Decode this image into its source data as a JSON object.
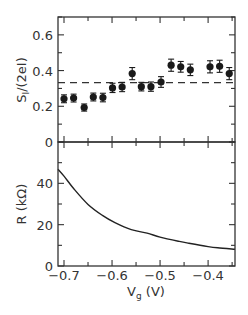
{
  "chart_data": [
    {
      "type": "scatter",
      "panel": "top",
      "title": "",
      "xlabel": "",
      "ylabel": "S_I/(2eI)",
      "ylabel_parts": {
        "main": "S",
        "sub": "I",
        "rest": "/(2eI)"
      },
      "xlim": [
        -0.7125,
        -0.344
      ],
      "ylim": [
        0,
        0.7
      ],
      "yticks": [
        0,
        0.2,
        0.4,
        0.6
      ],
      "ytick_labels": [
        "0",
        "0.2",
        "0.4",
        "0.6"
      ],
      "grid": false,
      "series": [
        {
          "name": "measured",
          "marker": "filled-circle",
          "x": [
            -0.7,
            -0.68,
            -0.658,
            -0.639,
            -0.619,
            -0.599,
            -0.579,
            -0.558,
            -0.539,
            -0.519,
            -0.498,
            -0.477,
            -0.457,
            -0.437,
            -0.396,
            -0.376,
            -0.356
          ],
          "y": [
            0.242,
            0.246,
            0.193,
            0.252,
            0.249,
            0.303,
            0.308,
            0.383,
            0.31,
            0.31,
            0.336,
            0.43,
            0.421,
            0.404,
            0.421,
            0.424,
            0.383
          ],
          "yerr": [
            0.022,
            0.022,
            0.02,
            0.022,
            0.024,
            0.026,
            0.026,
            0.034,
            0.024,
            0.026,
            0.03,
            0.034,
            0.03,
            0.032,
            0.034,
            0.034,
            0.034
          ]
        },
        {
          "name": "reference",
          "style": "dashed",
          "y_constant": 0.333
        }
      ]
    },
    {
      "type": "line",
      "panel": "bottom",
      "title": "",
      "xlabel": "V_g (V)",
      "xlabel_parts": {
        "main": "V",
        "sub": "g",
        "rest": " (V)"
      },
      "ylabel": "R (kΩ)",
      "xlim": [
        -0.7125,
        -0.344
      ],
      "ylim": [
        0,
        60
      ],
      "xticks": [
        -0.7,
        -0.6,
        -0.5,
        -0.4
      ],
      "xtick_labels": [
        "−0.7",
        "−0.6",
        "−0.5",
        "−0.4"
      ],
      "yticks": [
        0,
        20,
        40
      ],
      "ytick_labels": [
        "0",
        "20",
        "40"
      ],
      "grid": false,
      "series": [
        {
          "name": "R",
          "x": [
            -0.7125,
            -0.7,
            -0.68,
            -0.65,
            -0.62,
            -0.594,
            -0.56,
            -0.527,
            -0.5,
            -0.46,
            -0.44,
            -0.4,
            -0.38,
            -0.344
          ],
          "y": [
            46.8,
            43.5,
            37.5,
            29.8,
            24.5,
            21.0,
            17.6,
            15.9,
            14.0,
            11.9,
            11.0,
            9.4,
            8.8,
            8.1
          ]
        }
      ]
    }
  ],
  "labels": {
    "top_ylabel_main": "S",
    "top_ylabel_sub": "I",
    "top_ylabel_rest": "/(2eI)",
    "bottom_ylabel": "R (kΩ)",
    "xlabel_main": "V",
    "xlabel_sub": "g",
    "xlabel_rest": " (V)"
  },
  "colors": {
    "axis": "#333333",
    "marker": "#1a1a1a",
    "curve": "#222222",
    "background": "#ffffff"
  }
}
